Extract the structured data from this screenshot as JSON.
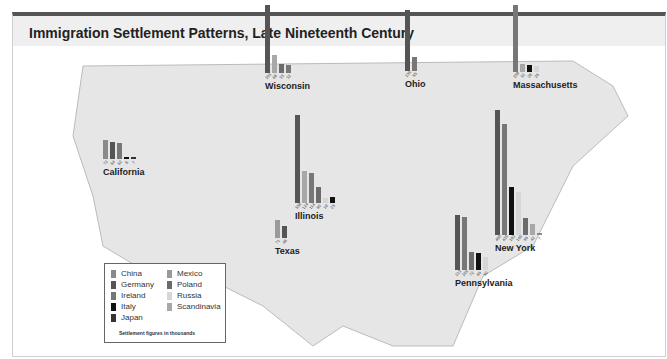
{
  "title": "Immigration Settlement Patterns, Late Nineteenth Century",
  "legend": {
    "items": [
      {
        "label": "China",
        "color": "#8a8a8a"
      },
      {
        "label": "Germany",
        "color": "#555555"
      },
      {
        "label": "Ireland",
        "color": "#777777"
      },
      {
        "label": "Italy",
        "color": "#111111"
      },
      {
        "label": "Japan",
        "color": "#333333"
      },
      {
        "label": "Mexico",
        "color": "#9a9a9a"
      },
      {
        "label": "Poland",
        "color": "#6b6b6b"
      },
      {
        "label": "Russia",
        "color": "#d6d6d6"
      },
      {
        "label": "Scandinavia",
        "color": "#a8a8a8"
      }
    ],
    "note": "Settlement figures in thousands"
  },
  "chart_data": {
    "type": "bar",
    "title": "Immigration Settlement Patterns, Late Nineteenth Century",
    "unit": "thousands",
    "groups": [
      {
        "state": "California",
        "values": [
          72,
          64,
          62,
          8,
          7
        ],
        "series": [
          "China",
          "Germany",
          "Ireland",
          "Italy",
          "Japan"
        ]
      },
      {
        "state": "Wisconsin",
        "values": [
          261,
          68,
          33,
          32
        ],
        "series": [
          "Germany",
          "Scandinavia",
          "Poland",
          "Ireland"
        ]
      },
      {
        "state": "Ohio",
        "values": [
          235,
          55
        ],
        "series": [
          "Germany",
          "Ireland"
        ]
      },
      {
        "state": "Massachusetts",
        "values": [
          259,
          32,
          28,
          26
        ],
        "series": [
          "Ireland",
          "Scandinavia",
          "Italy",
          "Russia"
        ]
      },
      {
        "state": "Illinois",
        "values": [
          338,
          124,
          114,
          60,
          19,
          23
        ],
        "series": [
          "Germany",
          "Scandinavia",
          "Ireland",
          "Poland",
          "Russia",
          "Italy"
        ]
      },
      {
        "state": "Texas",
        "values": [
          71,
          48
        ],
        "series": [
          "Mexico",
          "Germany"
        ]
      },
      {
        "state": "New York",
        "values": [
          480,
          425,
          182,
          165,
          66,
          42,
          7
        ],
        "series": [
          "Germany",
          "Ireland",
          "Italy",
          "Russia",
          "Poland",
          "Scandinavia",
          "China"
        ]
      },
      {
        "state": "Pennsylvania",
        "values": [
          213,
          205,
          72,
          66,
          50
        ],
        "series": [
          "Germany",
          "Ireland",
          "Poland",
          "Italy",
          "Russia"
        ]
      }
    ]
  }
}
